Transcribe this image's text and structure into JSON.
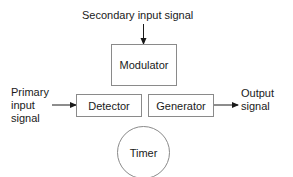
{
  "diagram": {
    "background_color": "#ffffff",
    "line_color": "#8a8a8a",
    "text_color": "#1a1a1a",
    "nodes": [
      {
        "id": "modulator",
        "shape": "rectangle",
        "label": "Modulator"
      },
      {
        "id": "detector",
        "shape": "rectangle",
        "label": "Detector"
      },
      {
        "id": "generator",
        "shape": "rectangle",
        "label": "Generator"
      },
      {
        "id": "timer",
        "shape": "circle",
        "label": "Timer"
      }
    ],
    "labels": {
      "secondary_input": "Secondary input signal",
      "primary_input_line1": "Primary",
      "primary_input_line2": "input",
      "primary_input_line3": "signal",
      "output_line1": "Output",
      "output_line2": "signal"
    },
    "arrows": [
      {
        "id": "secondary-into-modulator",
        "direction": "down",
        "from": "Secondary input signal",
        "to": "Modulator"
      },
      {
        "id": "primary-into-detector",
        "direction": "right",
        "from": "Primary input signal",
        "to": "Detector"
      },
      {
        "id": "generator-to-output",
        "direction": "right",
        "from": "Generator",
        "to": "Output signal"
      }
    ]
  }
}
